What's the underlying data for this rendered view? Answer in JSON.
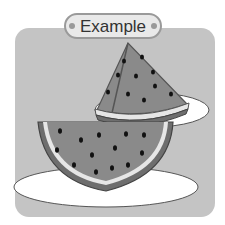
{
  "header": {
    "label": "Example"
  },
  "illustration": {
    "subject": "watermelon slices on plates",
    "colors": {
      "panel": "#c4c4c4",
      "flesh": "#8a8a8a",
      "rind": "#6e6e6e",
      "rind_inner": "#e6e6e6",
      "seed": "#111111",
      "plate": "#ffffff"
    }
  }
}
